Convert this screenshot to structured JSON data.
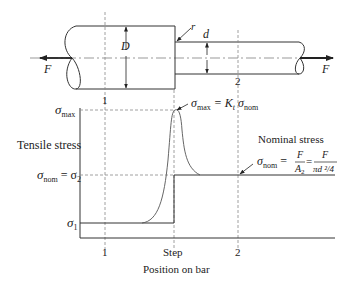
{
  "figure": {
    "bar": {
      "force_left": "F",
      "force_right": "F",
      "large_diameter": "D",
      "small_diameter": "d",
      "fillet_radius": "r",
      "station_1": "1",
      "station_2": "2"
    },
    "plot": {
      "y_label": "Tensile stress",
      "x_label": "Position on bar",
      "y_ticks": {
        "max_sym": "σ",
        "max_sub": "max",
        "nom_sym": "σ",
        "nom_sub": "nom",
        "nom_eq": " = σ",
        "nom_eq_sub": "2",
        "s1_sym": "σ",
        "s1_sub": "1"
      },
      "x_ticks": [
        "1",
        "Step",
        "2"
      ],
      "annotation_max": {
        "sym": "σ",
        "sub": "max",
        "eq": " = K",
        "k_sub": "t",
        "sym2": " σ",
        "sub2": "nom"
      },
      "annotation_nominal": {
        "title": "Nominal stress",
        "sym": "σ",
        "sub": "nom",
        "eq1": " = ",
        "frac1_num": "F",
        "frac1_den": "A",
        "frac1_den_sub": "2",
        "eq2": " = ",
        "frac2_num": "F",
        "frac2_den": "πd ²/4"
      }
    },
    "colors": {
      "line": "#333333",
      "dashed": "#888888"
    }
  }
}
